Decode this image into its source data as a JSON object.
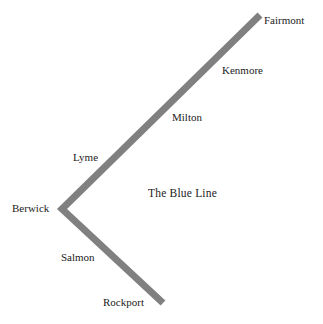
{
  "map": {
    "title": "The Blue Line",
    "title_position": {
      "x": 148,
      "y": 187
    },
    "line_color": "#808080",
    "text_color": "#222222",
    "background_color": "#ffffff",
    "line_width_px": 7,
    "route_points": [
      {
        "x": 260,
        "y": 15
      },
      {
        "x": 62,
        "y": 209
      },
      {
        "x": 163,
        "y": 303
      }
    ],
    "stations": [
      {
        "name": "Fairmont",
        "x": 264,
        "y": 14
      },
      {
        "name": "Kenmore",
        "x": 222,
        "y": 64
      },
      {
        "name": "Milton",
        "x": 172,
        "y": 111
      },
      {
        "name": "Lyme",
        "x": 73,
        "y": 151
      },
      {
        "name": "Berwick",
        "x": 12,
        "y": 202
      },
      {
        "name": "Salmon",
        "x": 61,
        "y": 251
      },
      {
        "name": "Rockport",
        "x": 103,
        "y": 296
      }
    ]
  }
}
